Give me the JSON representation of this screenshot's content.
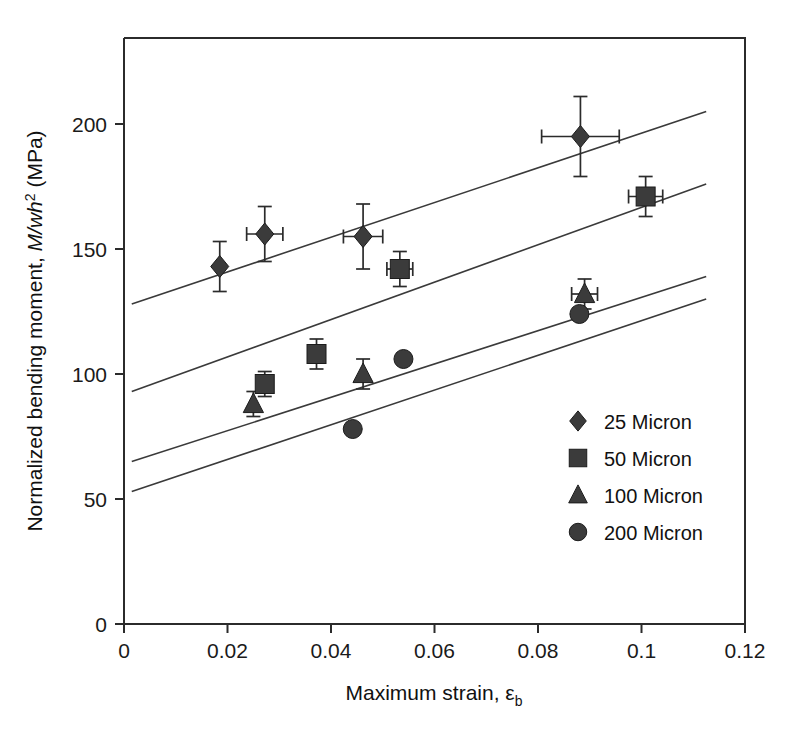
{
  "chart_data": {
    "type": "scatter",
    "title": "",
    "xlabel": "Maximum strain, εb",
    "xlabel_main": "Maximum strain, ",
    "xlabel_sym": "ε",
    "xlabel_sub": "b",
    "ylabel": "Normalized bending moment, M/wh2 (MPa)",
    "ylabel_pre": "Normalized bending moment, ",
    "ylabel_em": "M/wh",
    "ylabel_sup": "2",
    "ylabel_post": " (MPa)",
    "xlim": [
      0,
      0.12
    ],
    "ylim": [
      0,
      233
    ],
    "xticks": [
      0,
      0.02,
      0.04,
      0.06,
      0.08,
      0.1,
      0.12
    ],
    "xticklabels": [
      "0",
      "0.02",
      "0.04",
      "0.06",
      "0.08",
      "0.1",
      "0.12"
    ],
    "yticks": [
      0,
      50,
      100,
      150,
      200
    ],
    "yticklabels": [
      "0",
      "50",
      "100",
      "150",
      "200"
    ],
    "grid": false,
    "legend_position": "lower-right",
    "marker_color": "#3b3b3b",
    "line_color": "#3a3a3a",
    "axis_color": "#2b2b2b",
    "series": [
      {
        "name": "25 Micron",
        "marker": "diamond",
        "points": [
          {
            "x": 0.0185,
            "y": 143,
            "yerr": 10,
            "xerr": 0
          },
          {
            "x": 0.0272,
            "y": 156,
            "yerr": 11,
            "xerr": 0.0035
          },
          {
            "x": 0.0462,
            "y": 155,
            "yerr": 13,
            "xerr": 0.0038
          },
          {
            "x": 0.0882,
            "y": 195,
            "yerr": 16,
            "xerr": 0.0075
          }
        ],
        "trend": {
          "x1": 0.0015,
          "y1": 128,
          "x2": 0.1125,
          "y2": 205
        }
      },
      {
        "name": "50 Micron",
        "marker": "square",
        "points": [
          {
            "x": 0.0272,
            "y": 96,
            "yerr": 5,
            "xerr": 0
          },
          {
            "x": 0.0372,
            "y": 108,
            "yerr": 6,
            "xerr": 0
          },
          {
            "x": 0.0533,
            "y": 142,
            "yerr": 7,
            "xerr": 0.0025
          },
          {
            "x": 0.1008,
            "y": 171,
            "yerr": 8,
            "xerr": 0.0033
          }
        ],
        "trend": {
          "x1": 0.0015,
          "y1": 93,
          "x2": 0.1125,
          "y2": 176
        }
      },
      {
        "name": "100 Micron",
        "marker": "triangle",
        "points": [
          {
            "x": 0.025,
            "y": 88,
            "yerr": 5,
            "xerr": 0
          },
          {
            "x": 0.0462,
            "y": 100,
            "yerr": 6,
            "xerr": 0
          },
          {
            "x": 0.089,
            "y": 132,
            "yerr": 6,
            "xerr": 0.0025
          }
        ],
        "trend": {
          "x1": 0.0015,
          "y1": 65,
          "x2": 0.1125,
          "y2": 139
        }
      },
      {
        "name": "200 Micron",
        "marker": "circle",
        "points": [
          {
            "x": 0.0442,
            "y": 78,
            "yerr": 0,
            "xerr": 0
          },
          {
            "x": 0.054,
            "y": 106,
            "yerr": 0,
            "xerr": 0
          },
          {
            "x": 0.088,
            "y": 124,
            "yerr": 0,
            "xerr": 0
          }
        ],
        "trend": {
          "x1": 0.0015,
          "y1": 53,
          "x2": 0.1125,
          "y2": 130
        }
      }
    ],
    "legend": [
      {
        "label": "25 Micron",
        "marker": "diamond"
      },
      {
        "label": "50 Micron",
        "marker": "square"
      },
      {
        "label": "100 Micron",
        "marker": "triangle"
      },
      {
        "label": "200 Micron",
        "marker": "circle"
      }
    ]
  }
}
